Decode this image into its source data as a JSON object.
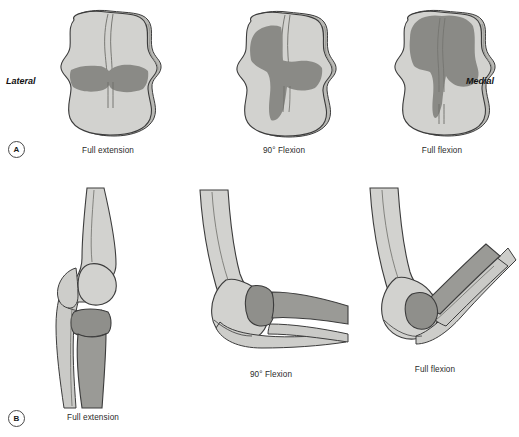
{
  "figure": {
    "background_color": "#ffffff"
  },
  "palette": {
    "bone_light": "#d2d2cf",
    "bone_mid": "#bdbdb9",
    "contact_dark": "#8a8a86",
    "outline": "#3c3c3c",
    "text": "#2b2b2b"
  },
  "side_labels": {
    "lateral": "Lateral",
    "medial": "Medial"
  },
  "rows": [
    {
      "marker": "A",
      "marker_name": "panel-marker-a",
      "panels": [
        {
          "caption": "Full extension",
          "icon": "knee-contact-full-extension"
        },
        {
          "caption": "90° Flexion",
          "icon": "knee-contact-90-flexion"
        },
        {
          "caption": "Full flexion",
          "icon": "knee-contact-full-flexion"
        }
      ]
    },
    {
      "marker": "B",
      "marker_name": "panel-marker-b",
      "panels": [
        {
          "caption": "Full extension",
          "icon": "elbow-full-extension"
        },
        {
          "caption": "90° Flexion",
          "icon": "elbow-90-flexion"
        },
        {
          "caption": "Full flexion",
          "icon": "elbow-full-flexion"
        }
      ]
    }
  ]
}
